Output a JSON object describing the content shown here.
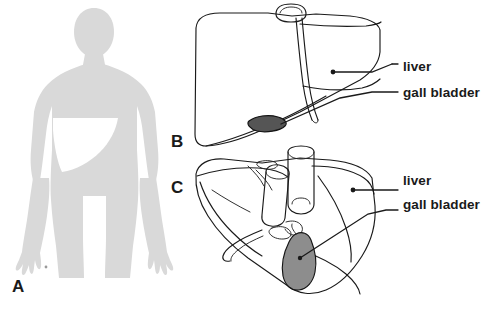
{
  "figure": {
    "background_color": "#ffffff",
    "ink_color": "#1a1a1a",
    "panels": [
      {
        "id": "A",
        "letter": "A",
        "caption": "Body silhouette showing liver position",
        "view": "body-outline-anterior",
        "silhouette_color": "#d9d9d9",
        "liver_region_color": "#ffffff",
        "labels": []
      },
      {
        "id": "B",
        "letter": "B",
        "caption": "Anterior view of liver",
        "view": "liver-anterior",
        "gallbladder_color": "#555555",
        "labels": [
          {
            "text": "liver",
            "target": "liver-body"
          },
          {
            "text": "gall bladder",
            "target": "gallbladder"
          }
        ]
      },
      {
        "id": "C",
        "letter": "C",
        "caption": "Inferior visceral view of liver",
        "view": "liver-inferior",
        "gallbladder_color": "#8d8d8d",
        "labels": [
          {
            "text": "liver",
            "target": "liver-body"
          },
          {
            "text": "gall bladder",
            "target": "gallbladder"
          }
        ]
      }
    ],
    "annotations": {
      "panel_b_liver": "liver",
      "panel_b_gallbladder": "gall bladder",
      "panel_c_liver": "liver",
      "panel_c_gallbladder": "gall bladder"
    },
    "panel_letters": {
      "a": "A",
      "b": "B",
      "c": "C"
    }
  }
}
